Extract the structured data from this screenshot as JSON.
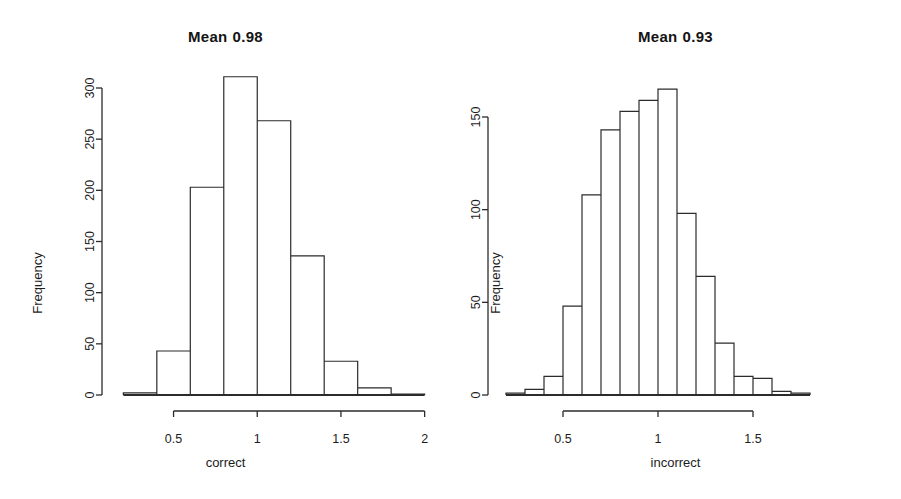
{
  "figure": {
    "background": "#ffffff",
    "ink_color": "#2b2b2b",
    "panels": [
      "left",
      "right"
    ]
  },
  "left_panel": {
    "title_prefix": "Mean",
    "title_value": "0.98",
    "xlabel": "correct",
    "ylabel": "Frequency",
    "x_ticks": [
      "0.5",
      "1.0",
      "1.5",
      "2.0"
    ],
    "y_ticks": [
      "0",
      "50",
      "100",
      "150",
      "200",
      "250",
      "300"
    ]
  },
  "right_panel": {
    "title_prefix": "Mean",
    "title_value": "0.93",
    "xlabel": "incorrect",
    "ylabel": "Frequency",
    "x_ticks": [
      "0.5",
      "1.0",
      "1.5"
    ],
    "y_ticks": [
      "0",
      "50",
      "100",
      "150"
    ]
  },
  "chart_data": [
    {
      "type": "bar",
      "id": "histogram-correct",
      "title": "Mean  0.98",
      "xlabel": "correct",
      "ylabel": "Frequency",
      "bin_width": 0.2,
      "bin_edges": [
        0.2,
        0.4,
        0.6,
        0.8,
        1.0,
        1.2,
        1.4,
        1.6,
        1.8,
        2.0
      ],
      "categories": [
        "0.2-0.4",
        "0.4-0.6",
        "0.6-0.8",
        "0.8-1.0",
        "1.0-1.2",
        "1.2-1.4",
        "1.4-1.6",
        "1.6-1.8",
        "1.8-2.0"
      ],
      "values": [
        2,
        43,
        203,
        311,
        268,
        136,
        33,
        7,
        1
      ],
      "xlim": [
        0.18,
        2.05
      ],
      "ylim": [
        0,
        311
      ],
      "x_tick_values": [
        0.5,
        1.0,
        1.5,
        2.0
      ],
      "y_tick_values": [
        0,
        50,
        100,
        150,
        200,
        250,
        300
      ],
      "grid": false,
      "legend": "none"
    },
    {
      "type": "bar",
      "id": "histogram-incorrect",
      "title": "Mean  0.93",
      "xlabel": "incorrect",
      "ylabel": "Frequency",
      "bin_width": 0.1,
      "bin_edges": [
        0.2,
        0.3,
        0.4,
        0.5,
        0.6,
        0.7,
        0.8,
        0.9,
        1.0,
        1.1,
        1.2,
        1.3,
        1.4,
        1.5,
        1.6,
        1.7,
        1.8
      ],
      "categories": [
        "0.2-0.3",
        "0.3-0.4",
        "0.4-0.5",
        "0.5-0.6",
        "0.6-0.7",
        "0.7-0.8",
        "0.8-0.9",
        "0.9-1.0",
        "1.0-1.1",
        "1.1-1.2",
        "1.2-1.3",
        "1.3-1.4",
        "1.4-1.5",
        "1.5-1.6",
        "1.6-1.7",
        "1.7-1.8"
      ],
      "values": [
        1,
        3,
        10,
        48,
        108,
        143,
        153,
        159,
        165,
        98,
        64,
        28,
        10,
        9,
        2,
        1
      ],
      "xlim": [
        0.2,
        1.8
      ],
      "ylim": [
        0,
        165
      ],
      "x_tick_values": [
        0.5,
        1.0,
        1.5
      ],
      "y_tick_values": [
        0,
        50,
        100,
        150
      ],
      "grid": false,
      "legend": "none"
    }
  ]
}
